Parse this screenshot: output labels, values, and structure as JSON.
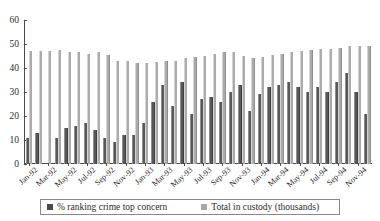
{
  "chart_data": {
    "type": "bar",
    "title": "",
    "xlabel": "",
    "ylabel": "",
    "ylim": [
      0,
      60
    ],
    "yticks": [
      0,
      10,
      20,
      30,
      40,
      50,
      60
    ],
    "grid": false,
    "legend_position": "bottom",
    "categories": [
      "Jan-92",
      "Feb-92",
      "Mar-92",
      "Apr-92",
      "May-92",
      "Jun-92",
      "Jul-92",
      "Aug-92",
      "Sep-92",
      "Oct-92",
      "Nov-92",
      "Dec-92",
      "Jan-93",
      "Feb-93",
      "Mar-93",
      "Apr-93",
      "May-93",
      "Jun-93",
      "Jul-93",
      "Aug-93",
      "Sep-93",
      "Oct-93",
      "Nov-93",
      "Dec-93",
      "Jan-94",
      "Feb-94",
      "Mar-94",
      "Apr-94",
      "May-94",
      "Jun-94",
      "Jul-94",
      "Aug-94",
      "Sep-94",
      "Oct-94",
      "Nov-94",
      "Dec-94"
    ],
    "tick_labels": [
      "Jan-92",
      "",
      "Mar-92",
      "",
      "May-92",
      "",
      "Jul-92",
      "",
      "Sep-92",
      "",
      "Nov-92",
      "",
      "Jan-93",
      "",
      "Mar-93",
      "",
      "May-93",
      "",
      "Jul-93",
      "",
      "Sep-93",
      "",
      "Nov-93",
      "",
      "Jan-94",
      "",
      "Mar-94",
      "",
      "May-94",
      "",
      "Jul-94",
      "",
      "Sep-94",
      "",
      "Nov-94",
      ""
    ],
    "series": [
      {
        "name": "% ranking crime top concern",
        "color": "#4a4a4a",
        "values": [
          11,
          13,
          0,
          11,
          15,
          16,
          17,
          14,
          11,
          9,
          12,
          12,
          17,
          26,
          33,
          24,
          34,
          21,
          27,
          28,
          26,
          30,
          33,
          22,
          29,
          32,
          33,
          34,
          32,
          30,
          32,
          30,
          34,
          38,
          30,
          21
        ]
      },
      {
        "name": "Total in custody (thousands)",
        "color": "#a6a6a6",
        "values": [
          47,
          47,
          47,
          47.5,
          46.5,
          46.5,
          46,
          46.5,
          45.5,
          43,
          43,
          42,
          42,
          42.5,
          43,
          43,
          44,
          44.5,
          45,
          46,
          46.5,
          46.5,
          45,
          44,
          44.5,
          45.5,
          46,
          46.5,
          47,
          47.5,
          48,
          48,
          48.5,
          49,
          49,
          49
        ]
      }
    ]
  },
  "legend": {
    "entries": [
      {
        "label": "% ranking crime top concern",
        "swatch": "dark"
      },
      {
        "label": "Total in custody (thousands)",
        "swatch": "light"
      }
    ]
  }
}
